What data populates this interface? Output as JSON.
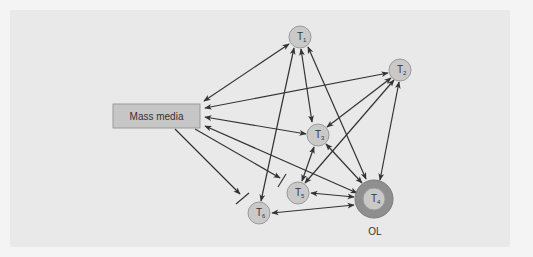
{
  "diagram": {
    "type": "two-step-flow communication network",
    "colors": {
      "page_bg": "#f4f4f4",
      "panel_bg": "#e9e9e9",
      "node_fill": "#c9c9c9",
      "node_stroke": "#9a9a9a",
      "opinion_leader_ring": "#8f8f8f",
      "media_box_fill": "#c6c6c6",
      "arrow": "#333333"
    },
    "media": {
      "label": "Mass media"
    },
    "nodes": [
      {
        "id": "T1",
        "base": "T",
        "sub": "1"
      },
      {
        "id": "T2",
        "base": "T",
        "sub": "2"
      },
      {
        "id": "T3",
        "base": "T",
        "sub": "3"
      },
      {
        "id": "T4",
        "base": "T",
        "sub": "4",
        "role": "opinion leader"
      },
      {
        "id": "T5",
        "base": "T",
        "sub": "5"
      },
      {
        "id": "T6",
        "base": "T",
        "sub": "6"
      }
    ],
    "opinion_leader_label": "OL",
    "edges": [
      {
        "from": "Mass media",
        "to": "T1",
        "type": "bidirectional"
      },
      {
        "from": "Mass media",
        "to": "T2",
        "type": "bidirectional"
      },
      {
        "from": "Mass media",
        "to": "T3",
        "type": "bidirectional"
      },
      {
        "from": "Mass media",
        "to": "T4",
        "type": "bidirectional"
      },
      {
        "from": "Mass media",
        "to": "T5",
        "type": "blocked"
      },
      {
        "from": "Mass media",
        "to": "T6",
        "type": "blocked"
      },
      {
        "from": "T1",
        "to": "T3",
        "type": "bidirectional"
      },
      {
        "from": "T1",
        "to": "T4",
        "type": "bidirectional"
      },
      {
        "from": "T1",
        "to": "T6",
        "type": "bidirectional"
      },
      {
        "from": "T2",
        "to": "T3",
        "type": "bidirectional"
      },
      {
        "from": "T2",
        "to": "T5",
        "type": "bidirectional"
      },
      {
        "from": "T2",
        "to": "T4",
        "type": "bidirectional"
      },
      {
        "from": "T3",
        "to": "T4",
        "type": "bidirectional"
      },
      {
        "from": "T3",
        "to": "T5",
        "type": "bidirectional"
      },
      {
        "from": "T4",
        "to": "T5",
        "type": "bidirectional"
      },
      {
        "from": "T4",
        "to": "T6",
        "type": "bidirectional"
      }
    ]
  }
}
